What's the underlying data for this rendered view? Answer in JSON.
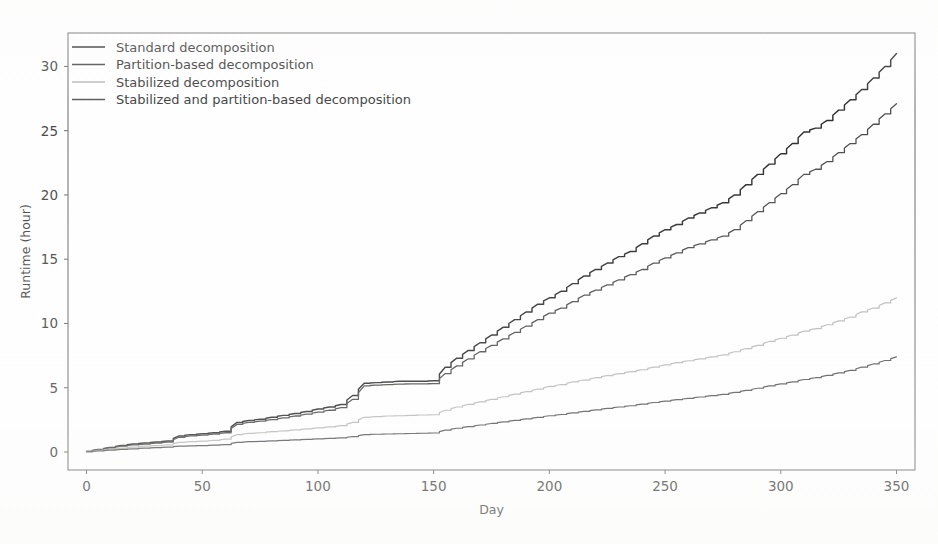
{
  "figure": {
    "background_color": "#fefefe",
    "frame_color": "#6e6e6e",
    "text_color": "#4a4a4a"
  },
  "chart_data": {
    "type": "line",
    "title": "",
    "xlabel": "Day",
    "ylabel": "Runtime (hour)",
    "xlim": [
      -8,
      358
    ],
    "ylim": [
      -1.4,
      32.6
    ],
    "xticks": [
      0,
      50,
      100,
      150,
      200,
      250,
      300,
      350
    ],
    "yticks": [
      0,
      5,
      10,
      15,
      20,
      25,
      30
    ],
    "grid": false,
    "legend_position": "upper left",
    "legend_frame": false,
    "x": [
      0,
      5,
      10,
      15,
      20,
      25,
      30,
      35,
      40,
      45,
      50,
      55,
      60,
      65,
      70,
      75,
      80,
      85,
      90,
      95,
      100,
      105,
      110,
      115,
      120,
      125,
      130,
      135,
      140,
      145,
      150,
      155,
      160,
      165,
      170,
      175,
      180,
      185,
      190,
      195,
      200,
      205,
      210,
      215,
      220,
      225,
      230,
      235,
      240,
      245,
      250,
      255,
      260,
      265,
      270,
      275,
      280,
      285,
      290,
      295,
      300,
      305,
      310,
      315,
      320,
      325,
      330,
      335,
      340,
      345,
      350
    ],
    "series": [
      {
        "name": "Standard decomposition",
        "color": "#2f2f2f",
        "linewidth": 1.45,
        "final_value": 31.0,
        "values": [
          0.05,
          0.2,
          0.35,
          0.5,
          0.62,
          0.7,
          0.78,
          0.85,
          1.25,
          1.35,
          1.42,
          1.5,
          1.62,
          2.3,
          2.45,
          2.55,
          2.7,
          2.85,
          3.0,
          3.15,
          3.35,
          3.5,
          3.7,
          4.4,
          5.35,
          5.4,
          5.45,
          5.5,
          5.5,
          5.5,
          5.55,
          6.6,
          7.3,
          7.9,
          8.5,
          9.1,
          9.7,
          10.3,
          10.9,
          11.5,
          12.0,
          12.5,
          13.1,
          13.7,
          14.2,
          14.7,
          15.2,
          15.6,
          16.2,
          16.8,
          17.3,
          17.7,
          18.2,
          18.6,
          19.0,
          19.4,
          20.0,
          20.8,
          21.6,
          22.4,
          23.2,
          24.0,
          24.9,
          25.2,
          25.8,
          26.6,
          27.4,
          28.2,
          29.1,
          30.0,
          31.0
        ]
      },
      {
        "name": "Partition-based decomposition",
        "color": "#4d4d4d",
        "linewidth": 1.3,
        "final_value": 27.1,
        "values": [
          0.04,
          0.18,
          0.32,
          0.45,
          0.55,
          0.62,
          0.7,
          0.78,
          1.15,
          1.25,
          1.32,
          1.4,
          1.5,
          2.15,
          2.3,
          2.4,
          2.52,
          2.65,
          2.8,
          2.95,
          3.1,
          3.25,
          3.45,
          4.1,
          5.15,
          5.2,
          5.25,
          5.28,
          5.3,
          5.3,
          5.32,
          6.1,
          6.7,
          7.25,
          7.8,
          8.3,
          8.8,
          9.3,
          9.8,
          10.3,
          10.8,
          11.2,
          11.7,
          12.2,
          12.6,
          13.0,
          13.4,
          13.8,
          14.2,
          14.7,
          15.1,
          15.5,
          15.9,
          16.2,
          16.5,
          16.8,
          17.3,
          18.0,
          18.7,
          19.4,
          20.1,
          20.8,
          21.6,
          22.0,
          22.6,
          23.3,
          24.0,
          24.7,
          25.5,
          26.3,
          27.1
        ]
      },
      {
        "name": "Stabilized decomposition",
        "color": "#b9b9b9",
        "linewidth": 1.2,
        "final_value": 12.0,
        "values": [
          0.03,
          0.12,
          0.22,
          0.3,
          0.38,
          0.45,
          0.5,
          0.55,
          0.75,
          0.8,
          0.85,
          0.9,
          1.0,
          1.35,
          1.45,
          1.5,
          1.58,
          1.65,
          1.72,
          1.8,
          1.88,
          1.95,
          2.05,
          2.3,
          2.7,
          2.75,
          2.8,
          2.82,
          2.85,
          2.88,
          2.9,
          3.25,
          3.5,
          3.7,
          3.9,
          4.1,
          4.3,
          4.5,
          4.7,
          4.9,
          5.1,
          5.25,
          5.45,
          5.6,
          5.78,
          5.95,
          6.1,
          6.25,
          6.4,
          6.6,
          6.78,
          6.95,
          7.1,
          7.25,
          7.4,
          7.55,
          7.8,
          8.05,
          8.3,
          8.6,
          8.85,
          9.1,
          9.4,
          9.6,
          9.9,
          10.2,
          10.5,
          10.9,
          11.2,
          11.6,
          12.0
        ]
      },
      {
        "name": "Stabilized and partition-based decomposition",
        "color": "#595959",
        "linewidth": 1.2,
        "final_value": 7.4,
        "values": [
          0.02,
          0.08,
          0.14,
          0.2,
          0.25,
          0.3,
          0.34,
          0.38,
          0.45,
          0.48,
          0.5,
          0.53,
          0.58,
          0.75,
          0.8,
          0.83,
          0.87,
          0.9,
          0.94,
          0.98,
          1.02,
          1.06,
          1.1,
          1.2,
          1.35,
          1.38,
          1.4,
          1.42,
          1.44,
          1.46,
          1.48,
          1.7,
          1.85,
          1.98,
          2.1,
          2.22,
          2.34,
          2.46,
          2.58,
          2.7,
          2.82,
          2.92,
          3.05,
          3.16,
          3.28,
          3.4,
          3.5,
          3.6,
          3.72,
          3.85,
          3.96,
          4.07,
          4.18,
          4.28,
          4.38,
          4.48,
          4.64,
          4.8,
          4.96,
          5.14,
          5.3,
          5.46,
          5.64,
          5.78,
          5.96,
          6.15,
          6.35,
          6.6,
          6.85,
          7.12,
          7.4
        ]
      }
    ]
  },
  "legend": {
    "entries": [
      {
        "label": "Standard decomposition"
      },
      {
        "label": "Partition-based decomposition"
      },
      {
        "label": "Stabilized decomposition"
      },
      {
        "label": "Stabilized and partition-based decomposition"
      }
    ]
  },
  "axes": {
    "x_tick_labels": [
      "0",
      "50",
      "100",
      "150",
      "200",
      "250",
      "300",
      "350"
    ],
    "y_tick_labels": [
      "0",
      "5",
      "10",
      "15",
      "20",
      "25",
      "30"
    ],
    "x_axis_label": "Day",
    "y_axis_label": "Runtime (hour)"
  }
}
